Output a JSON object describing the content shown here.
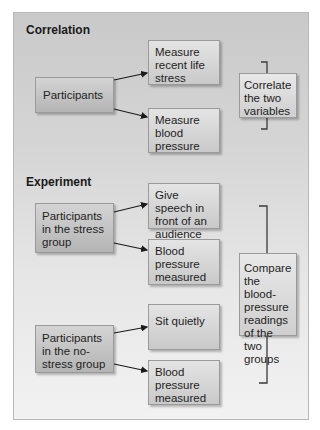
{
  "correlation": {
    "title": "Correlation",
    "source": "Participants",
    "steps": [
      "Measure recent life stress",
      "Measure blood pressure"
    ],
    "summary": "Correlate the two variables"
  },
  "experiment": {
    "title": "Experiment",
    "stress_group": {
      "label": "Participants in the stress group",
      "steps": [
        "Give speech in front of an audience",
        "Blood pressure measured"
      ]
    },
    "no_stress_group": {
      "label": "Participants in the no-stress group",
      "steps": [
        "Sit quietly",
        "Blood pressure measured"
      ]
    },
    "summary": "Compare the blood-pressure readings of the two groups"
  }
}
